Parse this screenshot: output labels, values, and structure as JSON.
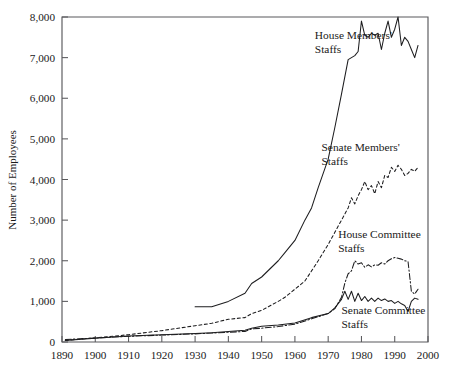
{
  "chart_data": {
    "type": "line",
    "title": "",
    "xlabel": "",
    "ylabel": "Number of Employees",
    "xlim": [
      1890,
      2000
    ],
    "ylim": [
      0,
      8000
    ],
    "grid": false,
    "legend_position": "inline-annotations",
    "x_ticks": [
      "1890",
      "1900",
      "1910",
      "1920",
      "1930",
      "1940",
      "1950",
      "1960",
      "1970",
      "1980",
      "1990",
      "2000"
    ],
    "x_tick_values": [
      1890,
      1900,
      1910,
      1920,
      1930,
      1940,
      1950,
      1960,
      1970,
      1980,
      1990,
      2000
    ],
    "y_ticks": [
      "0",
      "1,000",
      "2,000",
      "3,000",
      "4,000",
      "5,000",
      "6,000",
      "7,000",
      "8,000"
    ],
    "y_tick_values": [
      0,
      1000,
      2000,
      3000,
      4000,
      5000,
      6000,
      7000,
      8000
    ],
    "series": [
      {
        "name": "House Members' Staffs",
        "style": "solid",
        "label_x": 1966,
        "label_y": 7450,
        "x": [
          1930,
          1935,
          1940,
          1945,
          1947,
          1950,
          1955,
          1957,
          1960,
          1963,
          1965,
          1967,
          1970,
          1972,
          1974,
          1976,
          1977,
          1978,
          1979,
          1980,
          1981,
          1982,
          1983,
          1984,
          1985,
          1986,
          1987,
          1988,
          1989,
          1990,
          1991,
          1992,
          1993,
          1994,
          1995,
          1996,
          1997
        ],
        "y": [
          870,
          870,
          1000,
          1200,
          1440,
          1600,
          2000,
          2200,
          2500,
          3000,
          3300,
          3800,
          4500,
          5280,
          6100,
          6950,
          7000,
          7050,
          7150,
          7900,
          7550,
          7500,
          7600,
          7550,
          7600,
          7200,
          7600,
          7900,
          7500,
          7700,
          8000,
          7300,
          7500,
          7400,
          7200,
          7000,
          7300
        ]
      },
      {
        "name": "Senate Members' Staffs",
        "style": "dashed",
        "label_x": 1968,
        "label_y": 4700,
        "x": [
          1891,
          1900,
          1910,
          1920,
          1930,
          1935,
          1940,
          1945,
          1947,
          1950,
          1955,
          1957,
          1960,
          1963,
          1965,
          1967,
          1970,
          1972,
          1974,
          1976,
          1977,
          1978,
          1979,
          1980,
          1981,
          1982,
          1983,
          1984,
          1985,
          1986,
          1987,
          1988,
          1989,
          1990,
          1991,
          1992,
          1993,
          1994,
          1995,
          1996,
          1997
        ],
        "y": [
          40,
          100,
          180,
          280,
          400,
          460,
          560,
          600,
          700,
          780,
          1000,
          1100,
          1300,
          1500,
          1750,
          2000,
          2400,
          2700,
          3000,
          3300,
          3550,
          3400,
          3600,
          3750,
          3950,
          3750,
          3850,
          3650,
          3950,
          3800,
          4100,
          4050,
          4300,
          4200,
          4350,
          4250,
          4100,
          4150,
          4250,
          4200,
          4300
        ]
      },
      {
        "name": "House Committee Staffs",
        "style": "dashdot",
        "label_x": 1973,
        "label_y": 2550,
        "x": [
          1891,
          1900,
          1910,
          1920,
          1930,
          1935,
          1940,
          1945,
          1947,
          1950,
          1955,
          1960,
          1965,
          1970,
          1972,
          1974,
          1975,
          1976,
          1977,
          1978,
          1979,
          1980,
          1981,
          1982,
          1983,
          1984,
          1985,
          1986,
          1987,
          1988,
          1989,
          1990,
          1991,
          1992,
          1993,
          1994,
          1995,
          1996,
          1997
        ],
        "y": [
          60,
          100,
          140,
          170,
          200,
          220,
          240,
          260,
          320,
          340,
          380,
          440,
          570,
          700,
          820,
          1100,
          1450,
          1680,
          1750,
          2000,
          1920,
          1950,
          1840,
          1900,
          1850,
          1900,
          1890,
          1950,
          1920,
          2000,
          2050,
          2080,
          2060,
          2040,
          2000,
          1980,
          1250,
          1180,
          1300
        ]
      },
      {
        "name": "Senate Committee Staffs",
        "style": "solid",
        "label_x": 1974,
        "label_y": 700,
        "x": [
          1891,
          1900,
          1910,
          1920,
          1930,
          1935,
          1940,
          1945,
          1947,
          1950,
          1955,
          1960,
          1965,
          1970,
          1972,
          1974,
          1975,
          1976,
          1977,
          1978,
          1979,
          1980,
          1981,
          1982,
          1983,
          1984,
          1985,
          1986,
          1987,
          1988,
          1989,
          1990,
          1991,
          1992,
          1993,
          1994,
          1995,
          1996,
          1997
        ],
        "y": [
          40,
          90,
          150,
          180,
          210,
          230,
          260,
          290,
          340,
          390,
          420,
          470,
          600,
          700,
          840,
          1050,
          1250,
          1050,
          1250,
          1000,
          1200,
          1020,
          1120,
          1000,
          1080,
          1000,
          1080,
          1020,
          1060,
          1000,
          1020,
          950,
          1000,
          940,
          900,
          750,
          1000,
          1080,
          1050
        ]
      }
    ]
  },
  "axis": {
    "y_title": "Number of Employees"
  },
  "labels": {
    "house_members_line1": "House Members'",
    "house_members_line2": "Staffs",
    "senate_members_line1": "Senate Members'",
    "senate_members_line2": "Staffs",
    "house_committee_line1": "House Committee",
    "house_committee_line2": "Staffs",
    "senate_committee_line1": "Senate Committee",
    "senate_committee_line2": "Staffs"
  },
  "colors": {
    "line": "#1d1d1f",
    "frame": "#59595c",
    "background": "#ffffff",
    "text": "#1a1a1a"
  }
}
